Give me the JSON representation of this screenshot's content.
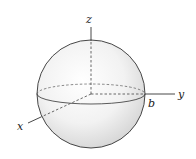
{
  "figure": {
    "labels": {
      "z": "z",
      "y": "y",
      "x": "x",
      "radius": "b"
    },
    "colors": {
      "sphere_fill_light": "#ffffff",
      "sphere_fill_dark": "#d9d9d9",
      "stroke": "#333333",
      "dashed": "#444444"
    }
  }
}
